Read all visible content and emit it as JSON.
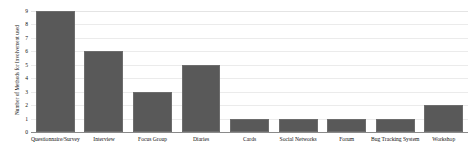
{
  "chart_data": {
    "type": "bar",
    "title": "",
    "xlabel": "",
    "ylabel": "Number of Methods for Involvement used",
    "ylim": [
      0,
      9
    ],
    "grid": true,
    "legend": false,
    "categories": [
      "Questionnaire/Survey",
      "Interview",
      "Focus Group",
      "Diaries",
      "Cards",
      "Social Networks",
      "Forum",
      "Bug Tracking System",
      "Workshop"
    ],
    "values": [
      9,
      6,
      3,
      5,
      1,
      1,
      1,
      1,
      2
    ],
    "yticks": [
      "0",
      "1",
      "2",
      "3",
      "4",
      "5",
      "6",
      "7",
      "8",
      "9"
    ],
    "colors": {
      "bar_fill": "#595959",
      "bar_edge": "#6d6d6d",
      "gridline": "#ebebeb",
      "axis_line": "#8a8a8a",
      "background": "#ffffff",
      "text": "#111111"
    }
  }
}
